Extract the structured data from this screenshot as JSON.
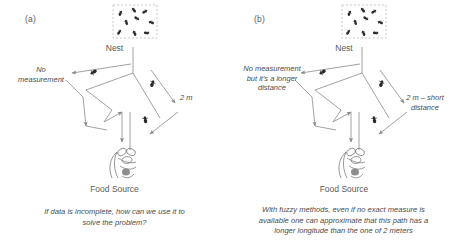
{
  "figure": {
    "background_color": "#ffffff",
    "line_color": "#8a8a8a",
    "text_color": "#4a4a4a",
    "ant_color": "#2b2b2b"
  },
  "panels": [
    {
      "letter": "(a)",
      "nest_label": "Nest",
      "food_label": "Food Source",
      "left_path_label": "No\nmeasurement",
      "right_path_label": "2 m",
      "caption": "If data is incomplete, how can we use it to\nsolve the problem?",
      "nest_ant_count": 9,
      "trail_ant_count": 3
    },
    {
      "letter": "(b)",
      "nest_label": "Nest",
      "food_label": "Food Source",
      "left_path_label": "No measurement\nbut  it's a longer\ndistance",
      "right_path_label": "2 m  –  short\ndistance",
      "caption": "With fuzzy methods, even if no exact measure is\navailable one can approximate that this path has a\nlonger longitude than the one of 2 meters",
      "nest_ant_count": 9,
      "trail_ant_count": 3
    }
  ]
}
